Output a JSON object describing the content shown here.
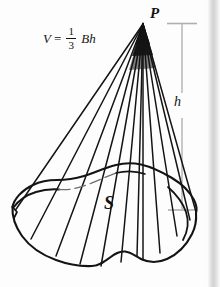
{
  "figure": {
    "kind": "geometry-diagram",
    "background_color": "#fdfdfd",
    "ink_color": "#121212",
    "guide_color": "#b4b4b4",
    "page_edge_color": "#d2d2d2"
  },
  "formula": {
    "lhs": "V",
    "equals": "=",
    "numerator": "1",
    "denominator": "3",
    "tail": "Bh",
    "plain": "V = 1/3 Bh"
  },
  "labels": {
    "apex": "P",
    "height": "h",
    "base_region": "S"
  },
  "geometry": {
    "apex_point": [
      143,
      23
    ],
    "height_line_x": 182,
    "height_line_top_y": 24,
    "height_line_bottom_y": 210,
    "base_leftmost": [
      12,
      207
    ],
    "base_rightmost": [
      196,
      213
    ],
    "base_bottom_y": 266,
    "ruling_count": 11
  }
}
